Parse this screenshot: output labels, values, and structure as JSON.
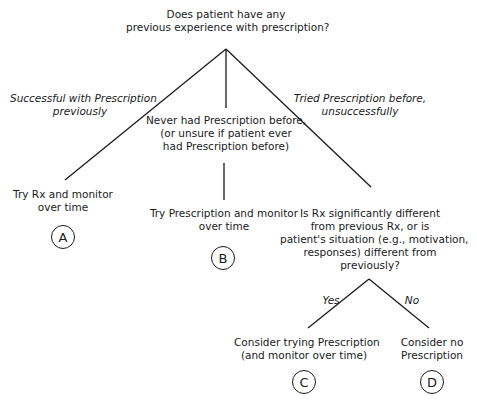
{
  "root": {
    "question_line1": "Does patient have any",
    "question_line2": "previous experience with prescription?"
  },
  "branches": {
    "left": {
      "line1": "Successful with Prescription",
      "line2": "previously"
    },
    "middle": {
      "line1": "Never had Prescription before,",
      "line2": "(or unsure if patient ever",
      "line3": "had Prescription before)"
    },
    "right": {
      "line1": "Tried Prescription before,",
      "line2": "unsuccessfully"
    }
  },
  "outcomes": {
    "A": {
      "line1": "Try Rx and monitor",
      "line2": "over time",
      "label": "A"
    },
    "B": {
      "line1": "Try Prescription and monitor",
      "line2": "over time",
      "label": "B"
    },
    "C": {
      "line1": "Consider trying Prescription",
      "line2": "(and monitor over time)",
      "label": "C"
    },
    "D": {
      "line1": "Consider no",
      "line2": "Prescription",
      "label": "D"
    }
  },
  "subquestion": {
    "line1": "Is Rx significantly different",
    "line2": "from previous Rx, or is",
    "line3": "patient's situation (e.g., motivation,",
    "line4": "responses) different from",
    "line5": "previously?"
  },
  "sub_branches": {
    "yes": "Yes",
    "no": "No"
  }
}
